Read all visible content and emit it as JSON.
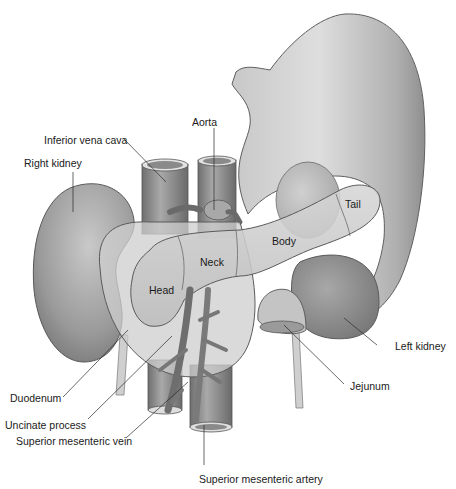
{
  "figure": {
    "colors": {
      "background": "#ffffff",
      "organ_light": "#d9d9d9",
      "organ_mid": "#b5b5b5",
      "organ_dark": "#7a7a7a",
      "outline": "#5a5a5a",
      "leader_line": "#2a2a2a",
      "text": "#1a1a1a"
    },
    "external_labels": [
      {
        "id": "inferior-vena-cava",
        "text": "Inferior vena cava"
      },
      {
        "id": "aorta",
        "text": "Aorta"
      },
      {
        "id": "right-kidney",
        "text": "Right kidney"
      },
      {
        "id": "left-kidney",
        "text": "Left kidney"
      },
      {
        "id": "jejunum",
        "text": "Jejunum"
      },
      {
        "id": "duodenum",
        "text": "Duodenum"
      },
      {
        "id": "uncinate-process",
        "text": "Uncinate process"
      },
      {
        "id": "superior-mesenteric-vein",
        "text": "Superior mesenteric vein"
      },
      {
        "id": "superior-mesenteric-artery",
        "text": "Superior mesenteric artery"
      }
    ],
    "pancreas_region_labels": [
      {
        "id": "head",
        "text": "Head"
      },
      {
        "id": "neck",
        "text": "Neck"
      },
      {
        "id": "body",
        "text": "Body"
      },
      {
        "id": "tail",
        "text": "Tail"
      }
    ]
  }
}
